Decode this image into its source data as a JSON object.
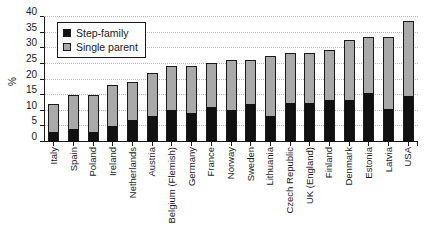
{
  "chart_data": {
    "type": "bar",
    "stacked": true,
    "title": "",
    "subtitle": "",
    "xlabel": "",
    "ylabel": "%",
    "ylim": [
      0,
      40
    ],
    "yticks": [
      0,
      5,
      10,
      15,
      20,
      25,
      30,
      35,
      40
    ],
    "ytick_labels": [
      "0",
      "5",
      "10",
      "15",
      "20",
      "25",
      "30",
      "35",
      "40"
    ],
    "grid": true,
    "grid_axis": "y",
    "grid_style": "dotted",
    "legend_position": "upper-left-inside",
    "categories": [
      "Italy",
      "Spain",
      "Poland",
      "Ireland",
      "Netherlands",
      "Austria",
      "Belgium (Flemish)",
      "Germany",
      "France",
      "Norway",
      "Sweden",
      "Lithuania",
      "Czech Republic",
      "UK (England)",
      "Finland",
      "Denmark",
      "Estonia",
      "Latvia",
      "USA"
    ],
    "series": [
      {
        "name": "Step-family",
        "color": "#111111",
        "values": [
          3.1,
          4.2,
          3.2,
          5.2,
          7.2,
          8.2,
          10.3,
          9.3,
          11.3,
          10.3,
          12.3,
          8.4,
          12.4,
          12.4,
          13.5,
          13.5,
          15.6,
          10.7,
          14.7
        ]
      },
      {
        "name": "Single parent",
        "color": "#a9a9a9",
        "values": [
          9.1,
          10.9,
          11.9,
          13.0,
          12.0,
          14.0,
          14.0,
          15.0,
          14.0,
          16.1,
          14.1,
          19.0,
          16.0,
          16.0,
          16.0,
          19.0,
          18.0,
          22.8,
          23.9
        ]
      }
    ],
    "totals": [
      12.2,
      15.1,
      15.1,
      18.2,
      19.2,
      22.2,
      24.3,
      24.3,
      25.3,
      26.4,
      26.4,
      27.4,
      28.4,
      28.4,
      29.5,
      32.5,
      33.6,
      33.5,
      38.6
    ]
  },
  "legend": {
    "items": [
      {
        "label": "Step-family",
        "color": "#111111"
      },
      {
        "label": "Single parent",
        "color": "#a9a9a9"
      }
    ]
  },
  "axis": {
    "y_title": "%"
  },
  "colors": {
    "step_family": "#111111",
    "single_parent": "#a9a9a9",
    "axis": "#1a1a1a",
    "grid": "#b9b9b9",
    "background": "#ffffff"
  }
}
